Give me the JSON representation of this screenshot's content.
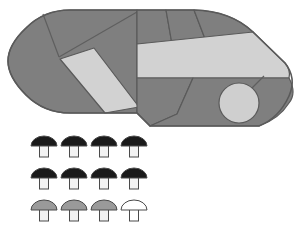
{
  "canvas": {
    "width": 306,
    "height": 239,
    "background": "#ffffff"
  },
  "palette": {
    "mid_gray": "#7f7f7f",
    "light_gray": "#d2d2d2",
    "pale_gray": "#cfcfcf",
    "outline": "#5a5a5a",
    "dark_cap": "#1a1a1a",
    "gray_cap": "#9a9a9a",
    "white_cap": "#ffffff",
    "stem_fill": "#f2f2f2",
    "stem_outline": "#4a4a4a"
  },
  "shape": {
    "name": "segmented-stadium-blob",
    "outline_path": "M 70 10 L 188 10 Q 232 10 254 31 L 284 62 Q 300 80 291 98 Q 281 117 259 126 L 149 126 L 136 113 L 70 113 Q 44 113 26 95 Q 8 77 8 61 Q 8 45 26 28 Q 44 10 70 10 Z",
    "segments": [
      {
        "name": "left-cap-region",
        "fill": "#7f7f7f",
        "path": "M 70 10 Q 44 10 26 28 Q 8 45 8 61 Q 8 77 26 95 Q 44 113 70 113 L 136 113 L 136 10 Z"
      },
      {
        "name": "left-divider-wedge",
        "fill": "#7f7f7f",
        "path": "M 44 14 L 58 58 L 92 50 Z"
      },
      {
        "name": "upper-left-triangle",
        "fill": "#7f7f7f",
        "path": "M 44 14 L 140 10 L 58 58 Z"
      },
      {
        "name": "light-parallelogram",
        "fill": "#d2d2d2",
        "path": "M 62 58 L 92 48 L 138 106 L 104 113 Z"
      },
      {
        "name": "top-segment-a",
        "fill": "#7f7f7f",
        "path": "M 136 10 L 165 10 L 171 44 L 136 44 Z"
      },
      {
        "name": "top-segment-b",
        "fill": "#7f7f7f",
        "path": "M 165 10 L 193 10 L 206 44 L 171 44 Z"
      },
      {
        "name": "top-segment-c",
        "fill": "#7f7f7f",
        "path": "M 193 10 Q 230 11 252 31 L 206 44 Z"
      },
      {
        "name": "light-band",
        "fill": "#d2d2d2",
        "path": "M 136 44 L 252 31 L 284 62 Q 290 70 288 77 L 136 77 Z"
      },
      {
        "name": "lower-mid-region",
        "fill": "#7f7f7f",
        "path": "M 136 77 L 192 77 L 176 113 L 149 126 L 136 113 Z"
      },
      {
        "name": "lower-right-region",
        "fill": "#7f7f7f",
        "path": "M 192 77 L 288 77 Q 296 92 288 102 Q 278 118 258 126 L 176 113 Z"
      },
      {
        "name": "circle-hole",
        "fill": "#cfcfcf",
        "cx": 239,
        "cy": 103,
        "r": 20
      }
    ]
  },
  "legend": {
    "name": "mushroom-icon-legend",
    "rows": [
      {
        "row_index": 0,
        "cap_color": "#1a1a1a",
        "count": 4,
        "icons": [
          {
            "label": "mushroom-dark-1",
            "cap": "#1a1a1a",
            "stem": "#f2f2f2"
          },
          {
            "label": "mushroom-dark-2",
            "cap": "#1a1a1a",
            "stem": "#f2f2f2"
          },
          {
            "label": "mushroom-dark-3",
            "cap": "#1a1a1a",
            "stem": "#f2f2f2"
          },
          {
            "label": "mushroom-dark-4",
            "cap": "#1a1a1a",
            "stem": "#f2f2f2"
          }
        ]
      },
      {
        "row_index": 1,
        "cap_color": "#1a1a1a",
        "count": 4,
        "icons": [
          {
            "label": "mushroom-dark-5",
            "cap": "#1a1a1a",
            "stem": "#f2f2f2"
          },
          {
            "label": "mushroom-dark-6",
            "cap": "#1a1a1a",
            "stem": "#f2f2f2"
          },
          {
            "label": "mushroom-dark-7",
            "cap": "#1a1a1a",
            "stem": "#f2f2f2"
          },
          {
            "label": "mushroom-dark-8",
            "cap": "#1a1a1a",
            "stem": "#f2f2f2"
          }
        ]
      },
      {
        "row_index": 2,
        "cap_color": "#9a9a9a",
        "count": 4,
        "icons": [
          {
            "label": "mushroom-gray-1",
            "cap": "#9a9a9a",
            "stem": "#f2f2f2"
          },
          {
            "label": "mushroom-gray-2",
            "cap": "#9a9a9a",
            "stem": "#f2f2f2"
          },
          {
            "label": "mushroom-gray-3",
            "cap": "#9a9a9a",
            "stem": "#f2f2f2"
          },
          {
            "label": "mushroom-white-1",
            "cap": "#ffffff",
            "stem": "#ffffff"
          }
        ]
      }
    ],
    "geometry": {
      "start_x": 44,
      "start_y": 146,
      "col_gap": 30,
      "row_gap": 32,
      "cap_rx": 13,
      "cap_ry": 10,
      "stem_w": 9,
      "stem_h": 12
    }
  }
}
